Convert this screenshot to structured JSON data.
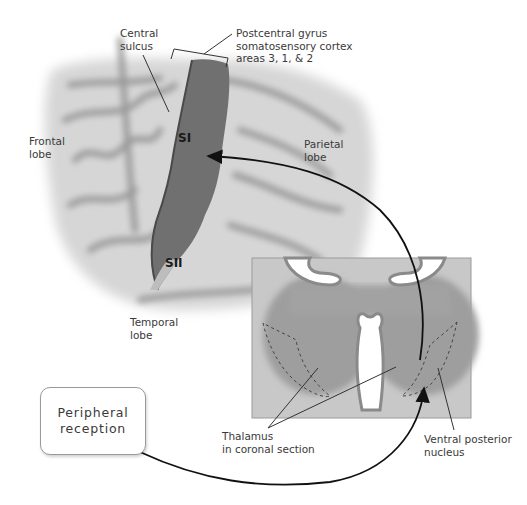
{
  "diagram": {
    "labels": {
      "central_sulcus": "Central\nsulcus",
      "postcentral_gyrus": "Postcentral gyrus\nsomatosensory cortex\nareas 3, 1, & 2",
      "frontal_lobe": "Frontal\nlobe",
      "parietal_lobe": "Parietal\nlobe",
      "temporal_lobe": "Temporal\nlobe",
      "si": "SI",
      "sii": "SII",
      "thalamus": "Thalamus\nin coronal section",
      "ventral_posterior_nucleus": "Ventral posterior\nnucleus",
      "peripheral_reception": "Peripheral\nreception"
    },
    "colors": {
      "brain_light": "#d4d4d4",
      "brain_sulcus": "#8c8c8c",
      "somatosensory_cortex": "#6e6e6e",
      "thalamus_panel_bg": "#c9c9c9",
      "thalamus_mass": "#9c9c9c",
      "arrow": "#111111"
    }
  }
}
